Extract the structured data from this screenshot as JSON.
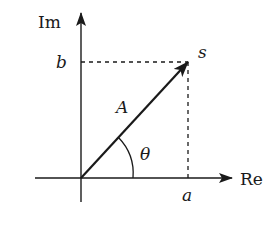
{
  "diagram": {
    "type": "complex-plane-phasor",
    "colors": {
      "ink": "#1a1a1a",
      "background": "#ffffff"
    },
    "axes": {
      "imaginary_label": "Im",
      "real_label": "Re"
    },
    "vector": {
      "magnitude_label": "A",
      "angle_label": "θ",
      "endpoint_label": "s"
    },
    "projections": {
      "real_component_label": "a",
      "imaginary_component_label": "b"
    }
  }
}
